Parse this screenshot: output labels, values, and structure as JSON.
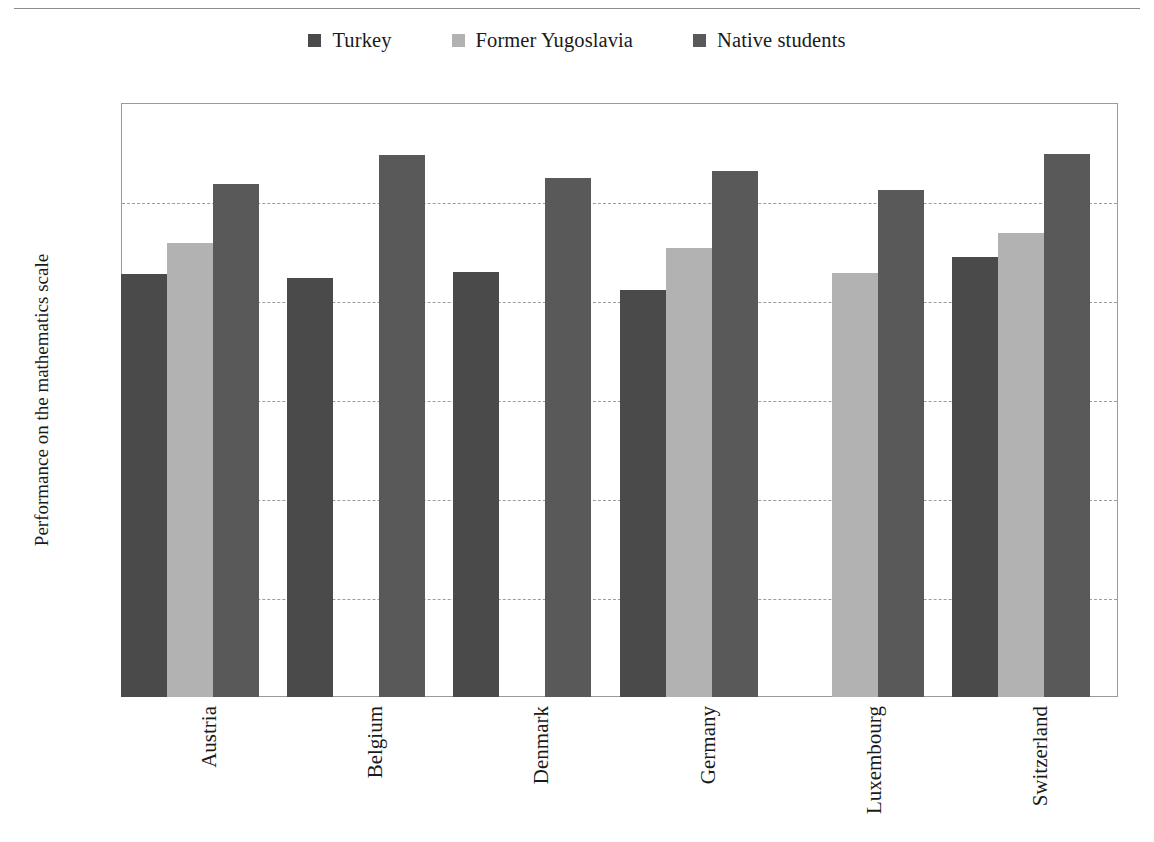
{
  "chart_data": {
    "type": "bar",
    "title": "",
    "xlabel": "",
    "ylabel": "Performance on the mathematics scale",
    "ylim": [
      0,
      600
    ],
    "ytick_step": 100,
    "yticks": [
      600,
      500,
      400,
      300,
      200,
      100,
      0
    ],
    "grid": "horizontal dashed",
    "legend_position": "top-center",
    "categories": [
      "Austria",
      "Belgium",
      "Denmark",
      "Germany",
      "Luxembourg",
      "Switzerland"
    ],
    "series": [
      {
        "name": "Turkey",
        "color": "#4a4a4a",
        "values": [
          427,
          423,
          429,
          411,
          null,
          444
        ]
      },
      {
        "name": "Former Yugoslavia",
        "color": "#b2b2b2",
        "values": [
          459,
          null,
          null,
          454,
          428,
          469
        ]
      },
      {
        "name": "Native students",
        "color": "#595959",
        "values": [
          518,
          547,
          524,
          531,
          512,
          549
        ]
      }
    ]
  },
  "legend": {
    "items": [
      {
        "label": "Turkey",
        "color": "#4a4a4a"
      },
      {
        "label": "Former Yugoslavia",
        "color": "#b2b2b2"
      },
      {
        "label": "Native students",
        "color": "#595959"
      }
    ]
  },
  "axes": {
    "y_title": "Performance on the mathematics scale",
    "y_ticks": [
      "600",
      "500",
      "400",
      "300",
      "200",
      "100",
      "0"
    ],
    "x_ticks": [
      "Austria",
      "Belgium",
      "Denmark",
      "Germany",
      "Luxembourg",
      "Switzerland"
    ]
  },
  "colors": {
    "turkey": "#4a4a4a",
    "former_yugoslavia": "#b2b2b2",
    "native_students": "#595959",
    "frame": "#9a9a9a",
    "gridline": "#9d9d9d",
    "rule": "#8c8c8c"
  }
}
